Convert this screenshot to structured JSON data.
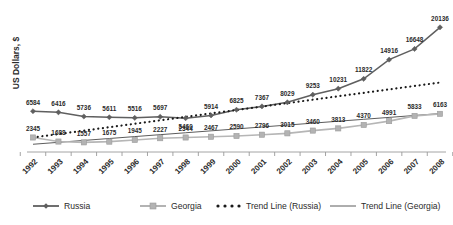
{
  "chart_data": {
    "type": "line",
    "title": "",
    "xlabel": "",
    "ylabel": "US Dollars, $",
    "categories": [
      "1992",
      "1993",
      "1994",
      "1995",
      "1996",
      "1997",
      "1998",
      "1999",
      "2000",
      "2001",
      "2002",
      "2003",
      "2004",
      "2005",
      "2006",
      "2007",
      "2008"
    ],
    "ylim": [
      0,
      21000
    ],
    "grid": false,
    "legend_position": "bottom",
    "series": [
      {
        "name": "Russia",
        "marker": "diamond",
        "color": "#5f5f5f",
        "values": [
          6584,
          6416,
          5736,
          5611,
          5516,
          5697,
          5460,
          5914,
          6825,
          7367,
          8029,
          9253,
          10231,
          11822,
          14916,
          16648,
          20136
        ],
        "labels": [
          "6584",
          "6416",
          "5736",
          "5611",
          "5516",
          "5697",
          "5460",
          "5914",
          "6825",
          "7367",
          "8029",
          "9253",
          "10231",
          "11822",
          "14916",
          "16648",
          "20136"
        ]
      },
      {
        "name": "Georgia",
        "marker": "square",
        "color": "#b3b3b3",
        "values": [
          2345,
          1688,
          1557,
          1675,
          1945,
          2227,
          2344,
          2467,
          2590,
          2796,
          3015,
          3460,
          3813,
          4370,
          4991,
          5833,
          6163
        ],
        "labels": [
          "2345",
          "1688",
          "1557",
          "1675",
          "1945",
          "2227",
          "2344",
          "2467",
          "2590",
          "2796",
          "3015",
          "3460",
          "3813",
          "4370",
          "4991",
          "5833",
          "6163"
        ]
      },
      {
        "name": "Trend Line (Russia)",
        "marker": "none",
        "style": "dotted",
        "color": "#1a1a1a",
        "values": [
          2345,
          2900,
          3455,
          4010,
          4565,
          5120,
          5675,
          6230,
          6785,
          7340,
          7895,
          8450,
          9005,
          9560,
          10115,
          10670,
          11225
        ]
      },
      {
        "name": "Trend Line (Georgia)",
        "marker": "none",
        "style": "solid-thin",
        "color": "#4a4a4a",
        "values": [
          1250,
          1560,
          1870,
          2180,
          2490,
          2800,
          3110,
          3420,
          3730,
          4040,
          4350,
          4660,
          4970,
          5280,
          5590,
          5900,
          6210
        ]
      }
    ]
  },
  "legend": {
    "items": [
      {
        "label": "Russia",
        "key": "russia"
      },
      {
        "label": "Georgia",
        "key": "georgia"
      },
      {
        "label": "Trend Line (Russia)",
        "key": "trend-russia"
      },
      {
        "label": "Trend Line (Georgia)",
        "key": "trend-georgia"
      }
    ]
  },
  "colors": {
    "russia": "#5f5f5f",
    "georgia": "#b3b3b3",
    "trend_russia": "#1a1a1a",
    "trend_georgia": "#4a4a4a",
    "axis": "#9a9a9a",
    "text": "#2b2b2b"
  }
}
